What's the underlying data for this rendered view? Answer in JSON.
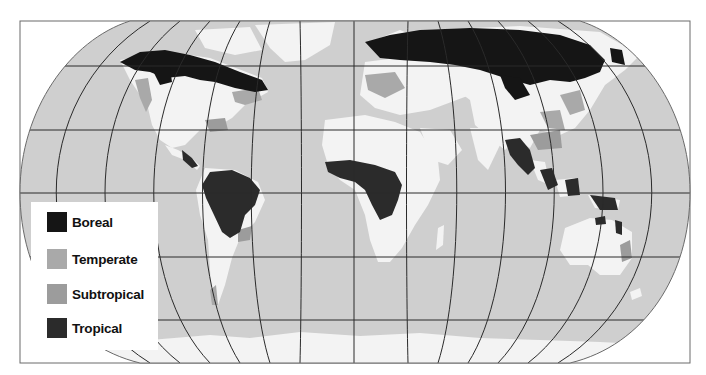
{
  "map": {
    "projection": "Robinson",
    "colors": {
      "ocean": "#cfcfcf",
      "land": "#f3f3f3",
      "graticule": "#2a2a2a",
      "frame": "#6a6a6a",
      "boreal": "#151515",
      "temperate": "#a9a9a9",
      "subtropical": "#9c9c9c",
      "tropical": "#2b2b2b"
    }
  },
  "legend": {
    "items": [
      {
        "label": "Boreal",
        "color": "#151515"
      },
      {
        "label": "Temperate",
        "color": "#a9a9a9"
      },
      {
        "label": "Subtropical",
        "color": "#9c9c9c"
      },
      {
        "label": "Tropical",
        "color": "#2b2b2b"
      }
    ]
  }
}
